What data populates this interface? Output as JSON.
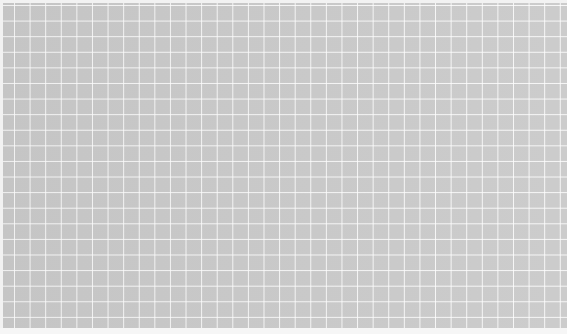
{
  "image": {
    "subject": "grid paper",
    "description": "Gray sheet with white grid lines",
    "colors": {
      "sheet": "#c9c9c9",
      "grid_lines": "#ffffff",
      "background": "#f2f2f2"
    }
  }
}
